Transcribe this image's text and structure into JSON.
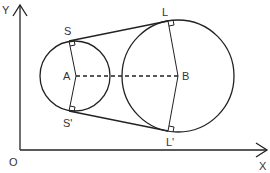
{
  "diagram": {
    "type": "geometry",
    "axes": {
      "x_label": "X",
      "y_label": "Y",
      "origin_label": "O"
    },
    "points": {
      "A": "A",
      "B": "B",
      "S": "S",
      "S_prime": "S'",
      "L": "L",
      "L_prime": "L'"
    },
    "segments": [
      {
        "from": "S",
        "to": "L",
        "style": "solid",
        "role": "common tangent"
      },
      {
        "from": "S'",
        "to": "L'",
        "style": "solid",
        "role": "common tangent"
      },
      {
        "from": "A",
        "to": "B",
        "style": "dashed",
        "role": "line of centres"
      },
      {
        "from": "A",
        "to": "S",
        "style": "solid",
        "role": "radius"
      },
      {
        "from": "A",
        "to": "S'",
        "style": "solid",
        "role": "radius"
      },
      {
        "from": "B",
        "to": "L",
        "style": "solid",
        "role": "radius"
      },
      {
        "from": "B",
        "to": "L'",
        "style": "solid",
        "role": "radius"
      }
    ],
    "circles": [
      {
        "centre": "A",
        "size": "smaller"
      },
      {
        "centre": "B",
        "size": "larger"
      }
    ],
    "right_angles": [
      "S",
      "S'",
      "L",
      "L'"
    ],
    "colors": {
      "stroke": "#222222",
      "label": "#333333",
      "background": "#ffffff"
    }
  }
}
